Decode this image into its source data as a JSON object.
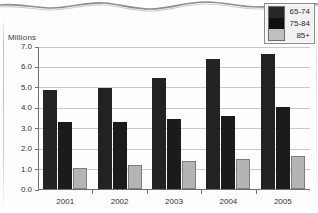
{
  "chart_data": {
    "type": "bar",
    "title": "",
    "ylabel": "Millions",
    "xlabel": "",
    "ylim": [
      0.0,
      7.0
    ],
    "ytick_step": 1.0,
    "ytick_labels": [
      "0.0",
      "1.0",
      "2.0",
      "3.0",
      "4.0",
      "5.0",
      "6.0",
      "7.0"
    ],
    "grid": true,
    "legend_position": "top-right",
    "categories": [
      "2001",
      "2002",
      "2003",
      "2004",
      "2005"
    ],
    "series": [
      {
        "name": "65-74",
        "color": "#232323",
        "values": [
          4.85,
          4.95,
          5.45,
          6.35,
          6.6
        ]
      },
      {
        "name": "75-84",
        "color": "#1b1b1b",
        "values": [
          3.3,
          3.3,
          3.45,
          3.55,
          4.0
        ]
      },
      {
        "name": "85+",
        "color": "#b4b4b4",
        "values": [
          1.05,
          1.2,
          1.35,
          1.45,
          1.6
        ]
      }
    ]
  },
  "legend": {
    "items": [
      {
        "label": "65-74",
        "swatch": "legend-swatch-65-74"
      },
      {
        "label": "75-84",
        "swatch": "legend-swatch-75-84"
      },
      {
        "label": "85+",
        "swatch": "legend-swatch-85-plus"
      }
    ]
  }
}
